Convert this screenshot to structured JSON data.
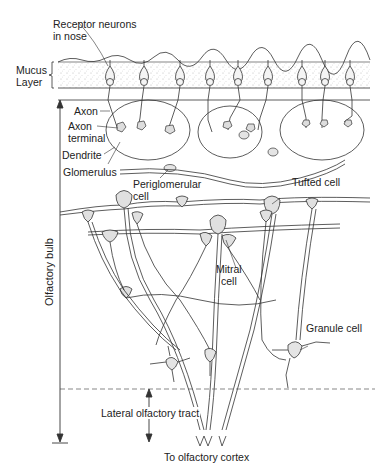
{
  "diagram": {
    "labels": {
      "receptor_line1": "Receptor neurons",
      "receptor_line2": "in nose",
      "mucus_line1": "Mucus",
      "mucus_line2": "Layer",
      "axon": "Axon",
      "axon_terminal_line1": "Axon",
      "axon_terminal_line2": "terminal",
      "dendrite": "Dendrite",
      "glomerulus": "Glomerulus",
      "periglomerular_line1": "Periglomerular",
      "periglomerular_line2": "cell",
      "tufted": "Tufted cell",
      "mitral_line1": "Mitral",
      "mitral_line2": "cell",
      "granule": "Granule cell",
      "olfactory_bulb": "Olfactory bulb",
      "lateral_tract": "Lateral olfactory tract",
      "to_cortex": "To olfactory cortex"
    },
    "colors": {
      "line": "#333333",
      "stipple": "#bdbdbd",
      "cell_fill": "#e4e4e4",
      "background": "#ffffff"
    }
  }
}
